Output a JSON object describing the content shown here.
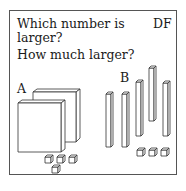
{
  "card": {
    "question_line1": "Which number is",
    "question_line2": "larger?",
    "question_line3": "How much larger?",
    "tag": "DF"
  },
  "figures": {
    "a_label": "A",
    "b_label": "B",
    "a": {
      "flats": 2,
      "rods": 0,
      "units": 4
    },
    "b": {
      "flats": 0,
      "rods": 5,
      "units": 3
    }
  },
  "colors": {
    "stroke": "#333333",
    "border": "#555555",
    "fill": "#ffffff"
  }
}
